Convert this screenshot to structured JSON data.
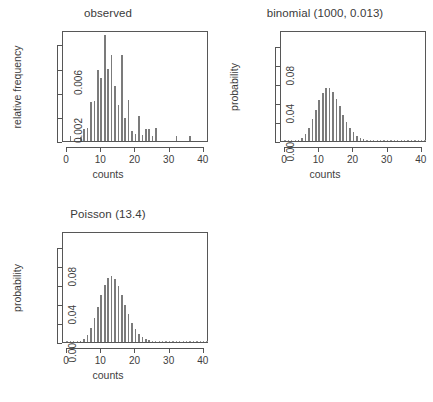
{
  "figure": {
    "layout": "2x2 grid, bottom-right empty",
    "background": "#ffffff",
    "bar_color": "#7b7b7b",
    "axis_color": "#555555",
    "text_color": "#3d3d3d"
  },
  "chart_data": [
    {
      "type": "bar",
      "id": "observed",
      "title": "observed",
      "xlabel": "counts",
      "ylabel": "relative frequency",
      "xlim": [
        -1.2,
        41.5
      ],
      "ylim": [
        0,
        0.0092
      ],
      "grid": false,
      "legend": null,
      "xticks": [
        0,
        10,
        20,
        30,
        40
      ],
      "xticklabels": [
        "0",
        "10",
        "20",
        "30",
        "40"
      ],
      "yticks": [
        0.002,
        0.006
      ],
      "yticklabels": [
        "0.002",
        "0.006"
      ],
      "yminorticks": [
        0.0,
        0.004,
        0.008
      ],
      "x": [
        1,
        4,
        5,
        6,
        7,
        8,
        9,
        10,
        11,
        12,
        13,
        14,
        15,
        16,
        17,
        18,
        19,
        20,
        21,
        22,
        23,
        24,
        25,
        26,
        32,
        36
      ],
      "values": [
        0.0004,
        0.0003,
        0.001,
        0.0011,
        0.0032,
        0.0033,
        0.0059,
        0.0052,
        0.0088,
        0.006,
        0.0071,
        0.0046,
        0.003,
        0.0071,
        0.0019,
        0.0034,
        0.0008,
        0.0006,
        0.0021,
        0.0005,
        0.001,
        0.001,
        0.0004,
        0.0011,
        0.0004,
        0.0004
      ]
    },
    {
      "type": "bar",
      "id": "binomial",
      "title": "binomial (1000, 0.013)",
      "xlabel": "counts",
      "ylabel": "probability",
      "xlim": [
        -1.2,
        41.5
      ],
      "ylim": [
        0,
        0.117
      ],
      "grid": false,
      "legend": null,
      "xticks": [
        0,
        10,
        20,
        30,
        40
      ],
      "xticklabels": [
        "0",
        "10",
        "20",
        "30",
        "40"
      ],
      "yticks": [
        0.0,
        0.04,
        0.08
      ],
      "yticklabels": [
        "0.00",
        "0.04",
        "0.08"
      ],
      "yminorticks": [
        0.02,
        0.06,
        0.1
      ],
      "params": {
        "n": 1000,
        "p": 0.013,
        "mean": 13.0
      },
      "x": [
        0,
        1,
        2,
        3,
        4,
        5,
        6,
        7,
        8,
        9,
        10,
        11,
        12,
        13,
        14,
        15,
        16,
        17,
        18,
        19,
        20,
        21,
        22,
        23,
        24,
        25,
        26,
        27,
        28,
        29,
        30,
        31,
        32,
        33,
        34,
        35,
        36,
        37,
        38,
        39,
        40,
        41
      ],
      "values": [
        0.0,
        0.0,
        0.0001,
        0.0004,
        0.0013,
        0.0035,
        0.0076,
        0.0141,
        0.023,
        0.0332,
        0.0432,
        0.0511,
        0.0554,
        0.0555,
        0.0516,
        0.0448,
        0.0364,
        0.0279,
        0.0201,
        0.0138,
        0.009,
        0.0056,
        0.0033,
        0.0019,
        0.001,
        0.0005,
        0.0003,
        0.0001,
        0.0001,
        0.0,
        0.0,
        0.0,
        0.0,
        0.0,
        0.0,
        0.0,
        0.0,
        0.0,
        0.0,
        0.0,
        0.0,
        0.0
      ]
    },
    {
      "type": "bar",
      "id": "poisson",
      "title": "Poisson (13.4)",
      "xlabel": "counts",
      "ylabel": "probability",
      "xlim": [
        -1.2,
        41.5
      ],
      "ylim": [
        0,
        0.117
      ],
      "grid": false,
      "legend": null,
      "xticks": [
        0,
        10,
        20,
        30,
        40
      ],
      "xticklabels": [
        "0",
        "10",
        "20",
        "30",
        "40"
      ],
      "yticks": [
        0.0,
        0.04,
        0.08
      ],
      "yticklabels": [
        "0.00",
        "0.04",
        "0.08"
      ],
      "yminorticks": [
        0.02,
        0.06,
        0.1
      ],
      "params": {
        "lambda": 13.4
      },
      "x": [
        0,
        1,
        2,
        3,
        4,
        5,
        6,
        7,
        8,
        9,
        10,
        11,
        12,
        13,
        14,
        15,
        16,
        17,
        18,
        19,
        20,
        21,
        22,
        23,
        24,
        25,
        26,
        27,
        28,
        29,
        30,
        31,
        32,
        33,
        34,
        35,
        36,
        37,
        38,
        39,
        40,
        41
      ],
      "values": [
        0.0,
        0.0,
        0.0001,
        0.0004,
        0.0013,
        0.0035,
        0.0077,
        0.0148,
        0.0248,
        0.0369,
        0.0494,
        0.0602,
        0.0672,
        0.0693,
        0.0663,
        0.0592,
        0.0496,
        0.0391,
        0.0291,
        0.0205,
        0.0137,
        0.0088,
        0.0053,
        0.0031,
        0.0017,
        0.0009,
        0.0005,
        0.0002,
        0.0001,
        0.0001,
        0.0,
        0.0,
        0.0,
        0.0,
        0.0,
        0.0,
        0.0,
        0.0,
        0.0,
        0.0,
        0.0,
        0.0
      ]
    }
  ]
}
